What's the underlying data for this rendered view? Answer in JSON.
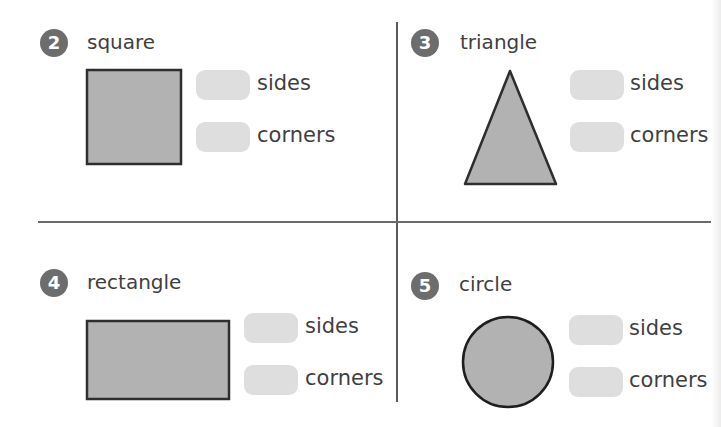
{
  "worksheet": {
    "questions": [
      {
        "number": "2",
        "shape": "square",
        "answers": [
          {
            "label": "sides",
            "value": ""
          },
          {
            "label": "corners",
            "value": ""
          }
        ]
      },
      {
        "number": "3",
        "shape": "triangle",
        "answers": [
          {
            "label": "sides",
            "value": ""
          },
          {
            "label": "corners",
            "value": ""
          }
        ]
      },
      {
        "number": "4",
        "shape": "rectangle",
        "answers": [
          {
            "label": "sides",
            "value": ""
          },
          {
            "label": "corners",
            "value": ""
          }
        ]
      },
      {
        "number": "5",
        "shape": "circle",
        "answers": [
          {
            "label": "sides",
            "value": ""
          },
          {
            "label": "corners",
            "value": ""
          }
        ]
      }
    ],
    "colors": {
      "shape_fill": "#b2b2b2",
      "shape_stroke": "#2e2e2e",
      "badge": "#6d6d6d",
      "answer_box": "#dedede"
    }
  }
}
